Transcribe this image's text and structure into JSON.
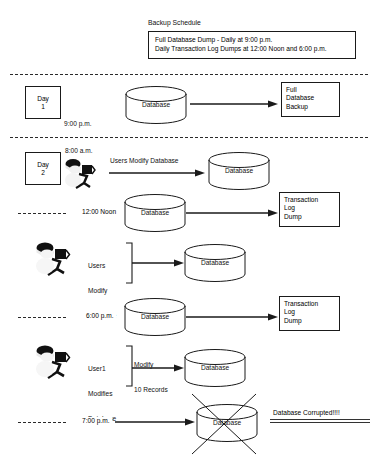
{
  "diagram": {
    "title": "Backup Schedule",
    "schedule_box": {
      "line1": "Full Database Dump - Daily at 9:00 p.m.",
      "line2": "Daily Transaction Log Dumps at 12:00 Noon and 6:00 p.m."
    },
    "day1": {
      "label_line1": "Day",
      "label_line2": "1",
      "time": "9:00 p.m.",
      "database_label": "Database",
      "output_line1": "Full",
      "output_line2": "Database",
      "output_line3": "Backup"
    },
    "day2": {
      "label_line1": "Day",
      "label_line2": "2",
      "time": "8:00 a.m.",
      "arrow_label": "Users Modify Database",
      "database_label": "Database"
    },
    "noon": {
      "time": "12:00 Noon",
      "database_label": "Database",
      "output_line1": "Transaction",
      "output_line2": "Log",
      "output_line3": "Dump"
    },
    "midday_users": {
      "label_line1": "Users",
      "label_line2": "Modify",
      "label_line3": "Database",
      "database_label": "Database"
    },
    "evening": {
      "time": "6:00 p.m.",
      "database_label": "Database",
      "output_line1": "Transaction",
      "output_line2": "Log",
      "output_line3": "Dump"
    },
    "user1": {
      "label_line1": "User1",
      "label_line2": "Modifies",
      "label_line3": "Database",
      "arrow_line1": "Modify",
      "arrow_line2": "10 Records",
      "database_label": "Database"
    },
    "corruption": {
      "time": "7:00 p.m.",
      "database_label": "Database",
      "message": "Database Corrupted!!!!"
    }
  },
  "colors": {
    "line": "#1a1a1a",
    "text": "#111111",
    "dash": "#2a2a2a",
    "background": "#ffffff"
  },
  "icons": {
    "database": "database-cylinder-icon",
    "person": "person-at-terminal-icon",
    "arrow": "arrow-right-icon",
    "bracket": "right-bracket-icon",
    "cross": "x-cross-icon"
  }
}
